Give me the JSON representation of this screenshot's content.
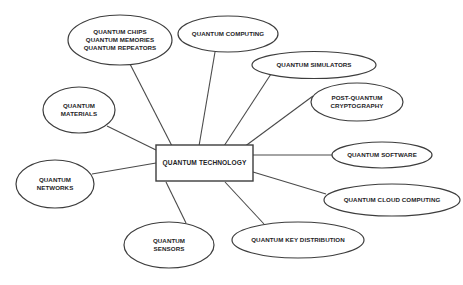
{
  "diagram": {
    "type": "mind-map",
    "background_color": "#ffffff",
    "stroke_color": "#3d3d3d",
    "text_color": "#24241f",
    "center": {
      "label": "QUANTUM TECHNOLOGY",
      "shape": "rectangle",
      "x": 204.5,
      "y": 163,
      "width": 97,
      "height": 36
    },
    "nodes": [
      {
        "id": "quantum-chips-memories-repeators",
        "lines": [
          "QUANTUM CHIPS",
          "QUANTUM MEMORIES",
          "QUANTUM REPEATORS"
        ],
        "shape": "ellipse",
        "cx": 120,
        "cy": 40,
        "rx": 52,
        "ry": 25,
        "connector": {
          "x1": 130,
          "y1": 64,
          "x2": 172,
          "y2": 146
        }
      },
      {
        "id": "quantum-computing",
        "lines": [
          "QUANTUM COMPUTING"
        ],
        "shape": "ellipse",
        "cx": 228,
        "cy": 34,
        "rx": 50,
        "ry": 18,
        "connector": {
          "x1": 215,
          "y1": 52,
          "x2": 199,
          "y2": 146
        }
      },
      {
        "id": "quantum-simulators",
        "lines": [
          "QUANTUM SIMULATORS"
        ],
        "shape": "ellipse",
        "cx": 314,
        "cy": 65,
        "rx": 62,
        "ry": 13.5,
        "connector": {
          "x1": 271,
          "y1": 74,
          "x2": 224,
          "y2": 146
        }
      },
      {
        "id": "post-quantum-cryptography",
        "lines": [
          "POST-QUANTUM",
          "CRYPTOGRAPHY"
        ],
        "shape": "ellipse",
        "cx": 357,
        "cy": 102,
        "rx": 46,
        "ry": 19,
        "connector": {
          "x1": 313,
          "y1": 96,
          "x2": 244,
          "y2": 147
        }
      },
      {
        "id": "quantum-software",
        "lines": [
          "QUANTUM SOFTWARE"
        ],
        "shape": "ellipse",
        "cx": 382,
        "cy": 155,
        "rx": 50,
        "ry": 13,
        "connector": {
          "x1": 332,
          "y1": 155,
          "x2": 253,
          "y2": 155
        }
      },
      {
        "id": "quantum-cloud-computing",
        "lines": [
          "QUANTUM CLOUD COMPUTING"
        ],
        "shape": "ellipse",
        "cx": 392,
        "cy": 200,
        "rx": 68,
        "ry": 16,
        "connector": {
          "x1": 326,
          "y1": 194,
          "x2": 253,
          "y2": 172
        }
      },
      {
        "id": "quantum-key-distribution",
        "lines": [
          "QUANTUM KEY DISTRIBUTION"
        ],
        "shape": "ellipse",
        "cx": 298,
        "cy": 240,
        "rx": 66,
        "ry": 18,
        "connector": {
          "x1": 264,
          "y1": 224,
          "x2": 225,
          "y2": 182
        }
      },
      {
        "id": "quantum-sensors",
        "lines": [
          "QUANTUM",
          "SENSORS"
        ],
        "shape": "ellipse",
        "cx": 169,
        "cy": 245,
        "rx": 45,
        "ry": 23,
        "connector": {
          "x1": 186,
          "y1": 223,
          "x2": 166,
          "y2": 182
        }
      },
      {
        "id": "quantum-networks",
        "lines": [
          "QUANTUM",
          "NETWORKS"
        ],
        "shape": "ellipse",
        "cx": 55,
        "cy": 184,
        "rx": 39,
        "ry": 24,
        "connector": {
          "x1": 92,
          "y1": 174,
          "x2": 156,
          "y2": 163
        }
      },
      {
        "id": "quantum-materials",
        "lines": [
          "QUANTUM",
          "MATERIALS"
        ],
        "shape": "ellipse",
        "cx": 79,
        "cy": 110,
        "rx": 36,
        "ry": 23,
        "connector": {
          "x1": 107,
          "y1": 126,
          "x2": 156,
          "y2": 150
        }
      }
    ]
  }
}
